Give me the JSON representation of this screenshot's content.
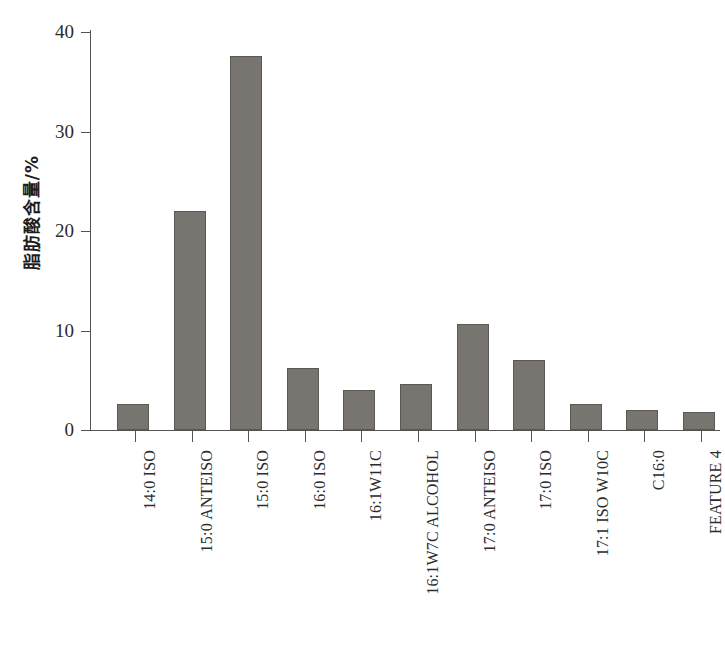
{
  "chart_data": {
    "type": "bar",
    "title": "",
    "subtitle": "",
    "xlabel": "",
    "ylabel": "脂肪酸含量/%",
    "ylim": [
      0,
      40
    ],
    "ytick_labels": [
      "0",
      "10",
      "20",
      "30",
      "40"
    ],
    "ytick_values": [
      0,
      10,
      20,
      30,
      40
    ],
    "grid": false,
    "legend": null,
    "legend_position": "none",
    "categories": [
      "14:0 ISO",
      "15:0 ANTEISO",
      "15:0 ISO",
      "16:0 ISO",
      "16:1W11C",
      "16:1W7C ALCOHOL",
      "17:0 ANTEISO",
      "17:0 ISO",
      "17:1 ISO W10C",
      "C16:0",
      "FEATURE 4"
    ],
    "values": [
      2.6,
      22.0,
      37.6,
      6.2,
      4.0,
      4.6,
      10.7,
      7.0,
      2.6,
      2.0,
      1.8
    ],
    "bar_color": "#787470",
    "bar_edge_color": "#5b5855",
    "axis_color": "#55524f"
  }
}
